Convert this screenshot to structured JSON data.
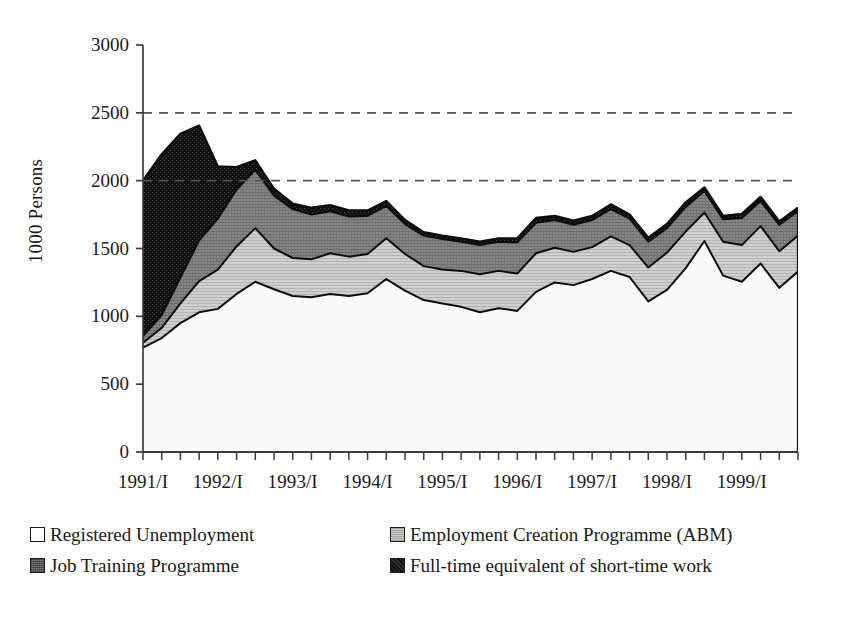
{
  "chart_data": {
    "type": "area",
    "stacked": true,
    "title": "",
    "xlabel": "",
    "ylabel": "1000 Persons",
    "ylim": [
      0,
      3000
    ],
    "yticks": [
      0,
      500,
      1000,
      1500,
      2000,
      2500,
      3000
    ],
    "ytick_labels": [
      "0",
      "500",
      "1000",
      "1500",
      "2000",
      "2500",
      "3000"
    ],
    "gridlines": {
      "visible": true,
      "style": "dashed",
      "values": [
        2000,
        2500
      ]
    },
    "x": [
      "1991/I",
      "1991/II",
      "1991/III",
      "1991/IV",
      "1992/I",
      "1992/II",
      "1992/III",
      "1992/IV",
      "1993/I",
      "1993/II",
      "1993/III",
      "1993/IV",
      "1994/I",
      "1994/II",
      "1994/III",
      "1994/IV",
      "1995/I",
      "1995/II",
      "1995/III",
      "1995/IV",
      "1996/I",
      "1996/II",
      "1996/III",
      "1996/IV",
      "1997/I",
      "1997/II",
      "1997/III",
      "1997/IV",
      "1998/I",
      "1998/II",
      "1998/III",
      "1998/IV",
      "1999/I",
      "1999/II",
      "1999/III",
      "1999/IV"
    ],
    "xtick_labels_shown": [
      "1991/I",
      "1992/I",
      "1993/I",
      "1994/I",
      "1995/I",
      "1996/I",
      "1997/I",
      "1998/I",
      "1999/I"
    ],
    "xtick_label_every": 4,
    "legend_position": "below",
    "series": [
      {
        "name": "Registered Unemployment",
        "color": "#ffffff",
        "values": [
          770,
          840,
          950,
          1030,
          1055,
          1165,
          1255,
          1200,
          1150,
          1140,
          1165,
          1150,
          1170,
          1275,
          1190,
          1120,
          1095,
          1070,
          1030,
          1060,
          1040,
          1180,
          1250,
          1230,
          1275,
          1335,
          1290,
          1110,
          1195,
          1355,
          1555,
          1300,
          1255,
          1390,
          1210,
          1330
        ]
      },
      {
        "name": "Employment Creation Programme (ABM)",
        "color": "#c9c9c9",
        "values": [
          35,
          75,
          145,
          230,
          290,
          350,
          395,
          300,
          280,
          280,
          300,
          290,
          290,
          300,
          270,
          250,
          250,
          265,
          280,
          275,
          275,
          285,
          255,
          245,
          235,
          255,
          235,
          250,
          275,
          270,
          210,
          250,
          270,
          275,
          270,
          265
        ]
      },
      {
        "name": "Job Training Programme",
        "color": "#7d7d7d",
        "values": [
          50,
          95,
          190,
          300,
          375,
          420,
          430,
          390,
          360,
          330,
          310,
          295,
          280,
          240,
          220,
          225,
          225,
          215,
          215,
          215,
          230,
          225,
          205,
          200,
          200,
          200,
          195,
          190,
          180,
          180,
          160,
          165,
          200,
          185,
          195,
          180
        ]
      },
      {
        "name": "Full-time equivalent of short-time work",
        "color": "#141414",
        "values": [
          1145,
          1185,
          1060,
          845,
          385,
          165,
          70,
          50,
          40,
          50,
          45,
          45,
          40,
          35,
          30,
          25,
          25,
          25,
          25,
          25,
          30,
          35,
          30,
          30,
          30,
          35,
          30,
          30,
          30,
          35,
          25,
          25,
          30,
          30,
          25,
          25
        ]
      }
    ]
  },
  "legend": {
    "items": [
      {
        "label": "Registered Unemployment",
        "swatch": "sw-white"
      },
      {
        "label": "Employment Creation Programme (ABM)",
        "swatch": "sw-lightgray"
      },
      {
        "label": "Job Training Programme",
        "swatch": "sw-darkgray"
      },
      {
        "label": "Full-time equivalent of short-time work",
        "swatch": "sw-black"
      }
    ]
  }
}
